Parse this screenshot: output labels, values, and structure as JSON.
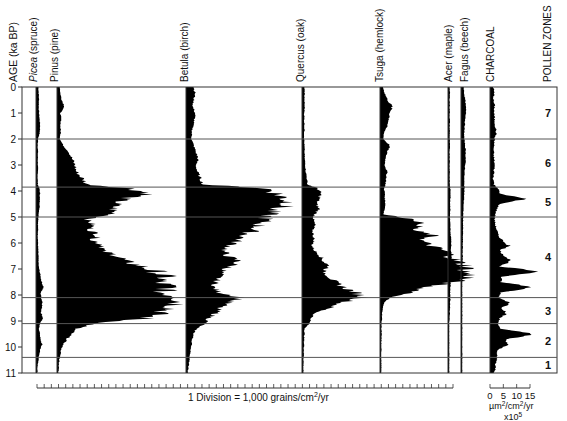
{
  "chart_data": {
    "type": "area",
    "title": "",
    "subtitle": "",
    "ylabel": "AGE (ka BP)",
    "ylim": [
      0,
      11
    ],
    "y_ticks": [
      0,
      1,
      2,
      3,
      4,
      5,
      6,
      7,
      8,
      9,
      10,
      11
    ],
    "orientation": "vertical-stratigraphic",
    "grid": "zone boundaries only",
    "zone_boundaries_ka": [
      2.0,
      3.85,
      5.0,
      8.1,
      9.1,
      10.4
    ],
    "pollen_zones": [
      {
        "label": "7",
        "from": 0,
        "to": 2.0
      },
      {
        "label": "6",
        "from": 2.0,
        "to": 3.85
      },
      {
        "label": "5",
        "from": 3.85,
        "to": 5.0
      },
      {
        "label": "4",
        "from": 5.0,
        "to": 8.1
      },
      {
        "label": "3",
        "from": 8.1,
        "to": 9.1
      },
      {
        "label": "2",
        "from": 9.1,
        "to": 10.4
      },
      {
        "label": "1",
        "from": 10.4,
        "to": 11
      }
    ],
    "x_scale_label": "1 Division = 1,000 grains/cm²/yr",
    "charcoal_scale": {
      "ticks": [
        "0",
        "5",
        "10",
        "15"
      ],
      "unit": "µm²/cm²/yr",
      "multiplier": "x10⁵"
    },
    "ages": [
      0,
      0.25,
      0.5,
      0.75,
      1,
      1.25,
      1.5,
      1.75,
      2,
      2.25,
      2.5,
      2.75,
      3,
      3.25,
      3.5,
      3.75,
      3.9,
      4.1,
      4.3,
      4.5,
      4.7,
      4.9,
      5.1,
      5.3,
      5.5,
      5.7,
      5.9,
      6.1,
      6.3,
      6.5,
      6.7,
      6.9,
      7.1,
      7.3,
      7.5,
      7.7,
      7.9,
      8.1,
      8.3,
      8.5,
      8.7,
      8.9,
      9.1,
      9.3,
      9.5,
      9.7,
      9.9,
      10.1,
      10.3,
      10.5,
      10.7,
      10.9,
      11
    ],
    "series": [
      {
        "name": "Picea (spruce)",
        "unit": "grains/cm²/yr (x1000)",
        "values": [
          1.2,
          1.5,
          1.8,
          1.6,
          1.8,
          2.4,
          3.0,
          2.6,
          0.8,
          0.6,
          0.7,
          0.6,
          0.7,
          0.6,
          0.5,
          0.6,
          2.2,
          2.8,
          2.5,
          2.6,
          2.2,
          1.5,
          1.2,
          0.8,
          0.8,
          0.7,
          0.8,
          0.8,
          1.0,
          1.2,
          1.3,
          1.5,
          2.5,
          3.5,
          4.5,
          6.5,
          3.5,
          4.0,
          5.5,
          4.5,
          4.0,
          6.0,
          2.5,
          1.8,
          2.8,
          3.2,
          4.8,
          3.0,
          2.0,
          1.2,
          0.5,
          0.3,
          0.2
        ]
      },
      {
        "name": "Pinus (pine)",
        "unit": "grains/cm²/yr (x1000)",
        "values": [
          1.2,
          1.5,
          2.5,
          4.5,
          1.5,
          2.0,
          1.5,
          1.8,
          1.2,
          3.5,
          7.5,
          9.5,
          11.5,
          12.5,
          16.5,
          20.0,
          50.0,
          64.0,
          45.0,
          40.0,
          38.0,
          38.0,
          20.0,
          24.0,
          22.0,
          28.0,
          24.0,
          32.0,
          30.0,
          42.0,
          46.0,
          58.0,
          68.0,
          74.0,
          69.0,
          78.0,
          71.0,
          86.0,
          84.0,
          80.0,
          70.0,
          60.0,
          25.0,
          12.0,
          9.0,
          6.0,
          3.5,
          2.0,
          1.5,
          0.8,
          0.5,
          0.3,
          0.2
        ]
      },
      {
        "name": "Betula (birch)",
        "unit": "grains/cm²/yr (x1000)",
        "values": [
          4.5,
          5.5,
          4.5,
          3.8,
          5.5,
          5.0,
          4.0,
          3.2,
          3.0,
          4.5,
          6.0,
          7.5,
          6.0,
          7.0,
          9.0,
          11.0,
          55.0,
          62.0,
          68.0,
          72.0,
          60.0,
          56.0,
          54.0,
          50.0,
          46.0,
          40.0,
          35.0,
          30.0,
          25.0,
          28.0,
          36.0,
          30.0,
          24.0,
          22.0,
          20.0,
          18.0,
          22.0,
          38.0,
          28.0,
          22.0,
          20.0,
          15.0,
          12.0,
          6.0,
          4.5,
          3.5,
          3.0,
          2.5,
          2.0,
          1.5,
          1.0,
          0.5,
          0.3
        ]
      },
      {
        "name": "Quercus (oak)",
        "unit": "grains/cm²/yr (x1000)",
        "values": [
          0.8,
          1.0,
          0.8,
          1.0,
          0.8,
          0.7,
          0.9,
          0.8,
          0.7,
          0.8,
          0.9,
          1.0,
          1.5,
          1.8,
          2.5,
          3.0,
          10.0,
          12.0,
          11.0,
          9.0,
          11.0,
          8.0,
          7.0,
          8.0,
          6.5,
          7.0,
          7.5,
          6.0,
          8.0,
          12.0,
          14.0,
          18.0,
          14.0,
          18.0,
          22.0,
          28.0,
          36.0,
          42.0,
          26.0,
          18.0,
          8.0,
          5.5,
          4.0,
          1.0,
          0.8,
          0.6,
          0.6,
          0.5,
          0.4,
          0.3,
          0.2,
          0.1,
          0.0
        ]
      },
      {
        "name": "Tsuga (hemlock)",
        "unit": "grains/cm²/yr (x1000)",
        "values": [
          1.2,
          2.5,
          4.5,
          7.5,
          6.0,
          5.5,
          4.0,
          2.0,
          1.5,
          6.0,
          4.0,
          3.0,
          2.5,
          4.0,
          3.5,
          3.0,
          2.0,
          2.5,
          2.5,
          3.0,
          2.5,
          1.5,
          24.0,
          28.0,
          22.0,
          36.0,
          28.0,
          34.0,
          44.0,
          48.0,
          52.0,
          60.0,
          58.0,
          62.0,
          50.0,
          30.0,
          22.0,
          6.0,
          2.0,
          1.0,
          0.8,
          0.5,
          0.3,
          0.2,
          0.2,
          0.1,
          0.0,
          0.0,
          0.0,
          0.0,
          0.0,
          0.0,
          0.0
        ]
      },
      {
        "name": "Acer (maple)",
        "unit": "grains/cm²/yr (x1000)",
        "values": [
          0.5,
          0.6,
          0.5,
          0.6,
          0.5,
          0.6,
          0.5,
          0.6,
          0.5,
          0.6,
          0.5,
          0.6,
          0.5,
          0.6,
          0.5,
          0.6,
          1.0,
          1.5,
          1.2,
          1.0,
          1.2,
          0.8,
          0.8,
          1.0,
          1.2,
          1.5,
          2.2,
          2.0,
          1.8,
          2.5,
          2.5,
          2.2,
          1.8,
          1.5,
          1.5,
          1.2,
          1.0,
          1.2,
          1.0,
          0.8,
          0.6,
          0.3,
          0.0,
          0.0,
          0.0,
          0.0,
          0.0,
          0.0,
          0.0,
          0.0,
          0.0,
          0.0,
          0.0
        ]
      },
      {
        "name": "Fagus (beech)",
        "unit": "grains/cm²/yr (x1000)",
        "values": [
          1.5,
          2.0,
          3.0,
          3.5,
          4.0,
          3.0,
          2.5,
          2.0,
          2.0,
          3.0,
          3.5,
          3.5,
          3.0,
          2.5,
          2.0,
          2.0,
          2.5,
          2.0,
          1.8,
          1.5,
          1.2,
          1.0,
          1.0,
          0.8,
          0.8,
          0.7,
          0.6,
          0.6,
          0.5,
          0.5,
          0.4,
          0.3,
          0.2,
          0.1,
          0.0,
          0.0,
          0.0,
          0.0,
          0.0,
          0.0,
          0.0,
          0.0,
          0.0,
          0.0,
          0.0,
          0.0,
          0.0,
          0.0,
          0.0,
          0.0,
          0.0,
          0.0,
          0.0
        ]
      },
      {
        "name": "CHARCOAL",
        "unit": "µm²/cm²/yr x10⁵",
        "values": [
          0.8,
          1.0,
          0.8,
          1.2,
          1.0,
          1.2,
          1.5,
          1.8,
          1.2,
          1.0,
          0.8,
          1.0,
          1.2,
          1.0,
          0.8,
          1.0,
          2.5,
          3.0,
          12.0,
          3.0,
          2.0,
          1.5,
          1.2,
          1.5,
          2.0,
          2.5,
          4.0,
          6.5,
          3.0,
          5.0,
          7.0,
          2.5,
          18.0,
          4.0,
          3.5,
          15.0,
          3.5,
          2.5,
          7.0,
          4.0,
          5.5,
          3.0,
          2.5,
          3.0,
          16.0,
          5.0,
          6.0,
          2.5,
          2.0,
          2.0,
          1.5,
          1.5,
          1.0
        ]
      }
    ]
  },
  "labels": {
    "age_axis": "AGE (ka BP)",
    "columns": [
      {
        "genus": "Picea",
        "common": " (spruce)",
        "italic": true
      },
      {
        "genus": "Pinus",
        "common": " (pine)",
        "italic": false
      },
      {
        "genus": "Betula",
        "common": " (birch)",
        "italic": false
      },
      {
        "genus": "Quercus",
        "common": " (oak)",
        "italic": false
      },
      {
        "genus": "Tsuga",
        "common": " (hemlock)",
        "italic": false
      },
      {
        "genus": "Acer",
        "common": " (maple)",
        "italic": false
      },
      {
        "genus": "Fagus",
        "common": " (beech)",
        "italic": false
      },
      {
        "genus": "CHARCOAL",
        "common": "",
        "italic": false
      }
    ],
    "pollen_zones_header": "POLLEN ZONES",
    "scale_text_main": "1 Division = 1,000 grains/cm",
    "scale_text_sup": "2",
    "scale_text_tail": "/yr",
    "charcoal_ticks": [
      "0",
      "5",
      "10",
      "15"
    ],
    "charcoal_unit_a": "µm",
    "charcoal_unit_b": "2",
    "charcoal_unit_c": "/cm",
    "charcoal_unit_d": "2",
    "charcoal_unit_e": "/yr",
    "charcoal_mult": "x10",
    "charcoal_mult_sup": "5"
  },
  "colors": {
    "fill": "#000000",
    "frame": "#333333",
    "zone_line": "#555555",
    "background": "#ffffff"
  }
}
